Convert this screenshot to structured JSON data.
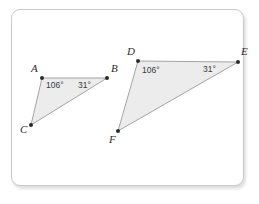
{
  "figure": {
    "background_color": "#ffffff",
    "frame_border_color": "#c9c9c9",
    "triangle_fill_color": "#ececec",
    "triangle_stroke_color": "#9a9a9a",
    "label_color": "#2b2b2b",
    "triangles": [
      {
        "name": "triangle-abc",
        "vertices": [
          {
            "label": "A",
            "x": 42,
            "y": 78,
            "label_x": 31,
            "label_y": 72
          },
          {
            "label": "B",
            "x": 107,
            "y": 78,
            "label_x": 111,
            "label_y": 72
          },
          {
            "label": "C",
            "x": 31,
            "y": 125,
            "label_x": 20,
            "label_y": 133
          }
        ],
        "angles": [
          {
            "label": "106°",
            "at_vertex": "A",
            "x": 46,
            "y": 88
          },
          {
            "label": "31°",
            "at_vertex": "B",
            "x": 78,
            "y": 88
          }
        ]
      },
      {
        "name": "triangle-def",
        "vertices": [
          {
            "label": "D",
            "x": 138,
            "y": 61,
            "label_x": 127,
            "label_y": 55
          },
          {
            "label": "E",
            "x": 238,
            "y": 62,
            "label_x": 241,
            "label_y": 55
          },
          {
            "label": "F",
            "x": 118,
            "y": 131,
            "label_x": 109,
            "label_y": 143
          }
        ],
        "angles": [
          {
            "label": "106°",
            "at_vertex": "D",
            "x": 142,
            "y": 73
          },
          {
            "label": "31°",
            "at_vertex": "E",
            "x": 203,
            "y": 72
          }
        ]
      }
    ]
  }
}
